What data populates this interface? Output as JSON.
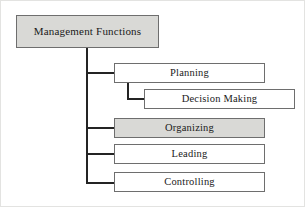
{
  "diagram": {
    "title": "Management Functions",
    "type": "hierarchy-tree",
    "colors": {
      "shaded_fill": "#d9d9d6",
      "plain_fill": "#ffffff",
      "box_border": "#6e6e6e",
      "connector": "#242424",
      "text": "#1a1a1a",
      "canvas_border": "#e3e3e1"
    },
    "root": {
      "label": "Management Functions",
      "shaded": true
    },
    "nodes": [
      {
        "label": "Planning",
        "shaded": false,
        "level": 1
      },
      {
        "label": "Decision Making",
        "shaded": false,
        "level": 2
      },
      {
        "label": "Organizing",
        "shaded": true,
        "level": 1
      },
      {
        "label": "Leading",
        "shaded": false,
        "level": 1
      },
      {
        "label": "Controlling",
        "shaded": false,
        "level": 1
      }
    ],
    "connectors": [
      {
        "name": "root-trunk",
        "from": "Management Functions",
        "to": "trunk"
      },
      {
        "name": "trunk-to-planning",
        "from": "trunk",
        "to": "Planning"
      },
      {
        "name": "planning-to-decision",
        "from": "Planning",
        "to": "Decision Making"
      },
      {
        "name": "trunk-to-organizing",
        "from": "trunk",
        "to": "Organizing"
      },
      {
        "name": "trunk-to-leading",
        "from": "trunk",
        "to": "Leading"
      },
      {
        "name": "trunk-to-controlling",
        "from": "trunk",
        "to": "Controlling"
      }
    ]
  }
}
